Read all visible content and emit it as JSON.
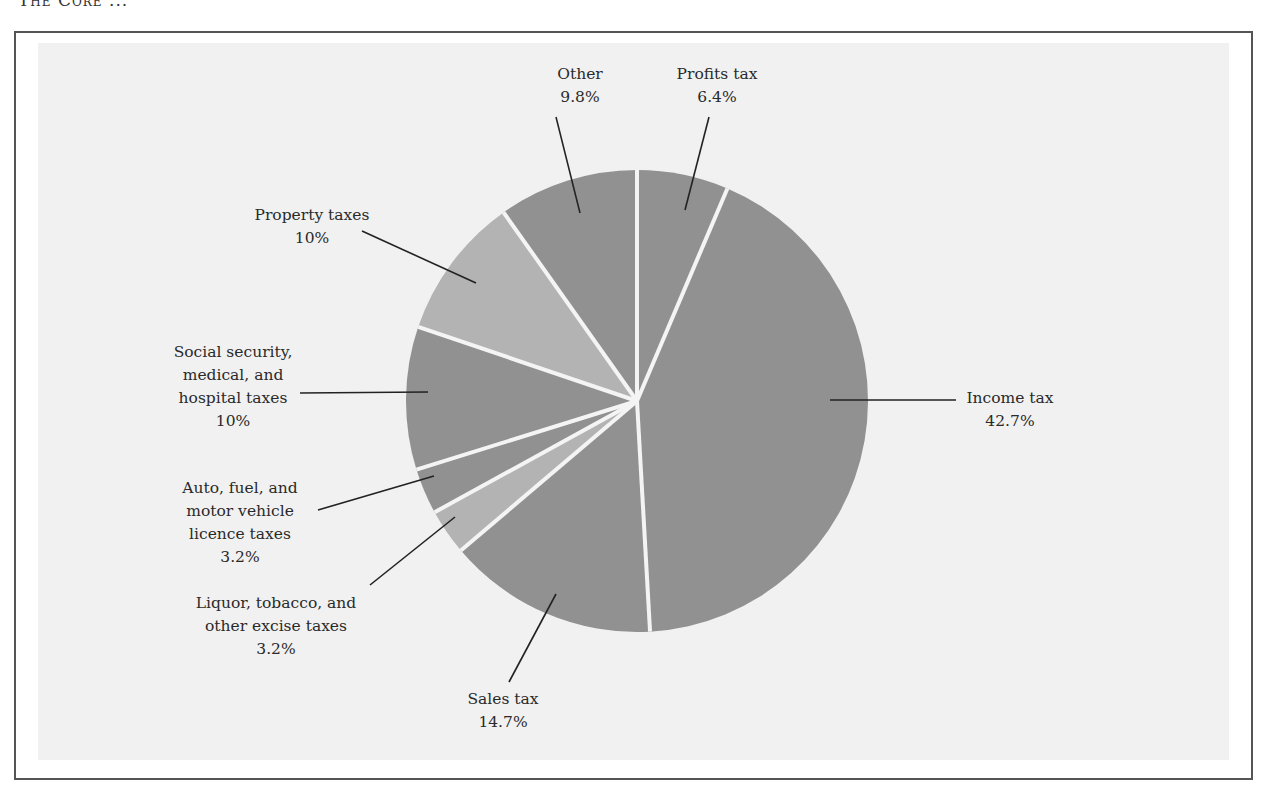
{
  "header": {
    "running_head": "The Core ..."
  },
  "colors": {
    "slice_dark": "#919191",
    "slice_light": "#b3b3b3",
    "separator": "#f4f4f4",
    "leader": "#222222",
    "frame": "#555555",
    "background": "#f1f1f1"
  },
  "chart_data": {
    "type": "pie",
    "title": "",
    "start_angle": "12 o'clock, clockwise",
    "slices": [
      {
        "label": "Profits tax",
        "value": 6.4,
        "value_label": "6.4%"
      },
      {
        "label": "Income tax",
        "value": 42.7,
        "value_label": "42.7%"
      },
      {
        "label": "Sales tax",
        "value": 14.7,
        "value_label": "14.7%"
      },
      {
        "label": "Liquor, tobacco, and other excise taxes",
        "value": 3.2,
        "value_label": "3.2%"
      },
      {
        "label": "Auto, fuel, and motor vehicle licence taxes",
        "value": 3.2,
        "value_label": "3.2%"
      },
      {
        "label": "Social security, medical, and hospital taxes",
        "value": 10,
        "value_label": "10%"
      },
      {
        "label": "Property taxes",
        "value": 10,
        "value_label": "10%"
      },
      {
        "label": "Other",
        "value": 9.8,
        "value_label": "9.8%"
      }
    ],
    "categories": [
      "Profits tax",
      "Income tax",
      "Sales tax",
      "Liquor, tobacco, and other excise taxes",
      "Auto, fuel, and motor vehicle licence taxes",
      "Social security, medical, and hospital taxes",
      "Property taxes",
      "Other"
    ],
    "values": [
      6.4,
      42.7,
      14.7,
      3.2,
      3.2,
      10,
      10,
      9.8
    ],
    "legend": "none (direct labels with leader lines)"
  },
  "labels": {
    "other": {
      "lines": [
        "Other",
        "9.8%"
      ]
    },
    "profits": {
      "lines": [
        "Profits tax",
        "6.4%"
      ]
    },
    "property": {
      "lines": [
        "Property taxes",
        "10%"
      ]
    },
    "social": {
      "lines": [
        "Social security,",
        "medical, and",
        "hospital taxes",
        "10%"
      ]
    },
    "auto": {
      "lines": [
        "Auto, fuel, and",
        "motor vehicle",
        "licence taxes",
        "3.2%"
      ]
    },
    "liquor": {
      "lines": [
        "Liquor, tobacco, and",
        "other excise taxes",
        "3.2%"
      ]
    },
    "sales": {
      "lines": [
        "Sales tax",
        "14.7%"
      ]
    },
    "income": {
      "lines": [
        "Income tax",
        "42.7%"
      ]
    }
  }
}
